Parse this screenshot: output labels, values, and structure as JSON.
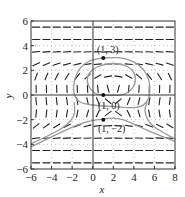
{
  "chart_data": {
    "type": "slope_field",
    "title": "",
    "xlabel": "x",
    "ylabel": "y",
    "xlim": [
      -6,
      8
    ],
    "ylim": [
      -6,
      6
    ],
    "xticks": [
      -6,
      -4,
      -2,
      0,
      2,
      4,
      6,
      8
    ],
    "yticks": [
      -6,
      -4,
      -2,
      0,
      2,
      4,
      6
    ],
    "grid": "dotted",
    "points": [
      {
        "x": 1,
        "y": 3,
        "label": "(1, 3)"
      },
      {
        "x": 1,
        "y": 0,
        "label": "(1, 0)"
      },
      {
        "x": 1,
        "y": -2,
        "label": "(1, −2)"
      }
    ],
    "solution_curves": [
      {
        "through": "(1, 3)",
        "shape": "closed loop around center near (2, 1)"
      },
      {
        "through": "(1, 0)",
        "shape": "inner closed loop around center near (2, 1)"
      },
      {
        "through": "(1, -2)",
        "shape": "open arch, peak near (2, -1.8), descending to lower left and lower right"
      }
    ]
  },
  "labels": {
    "x_axis": "x",
    "y_axis": "y",
    "x_ticks": [
      "−6",
      "−4",
      "−2",
      "0",
      "2",
      "4",
      "6",
      "8"
    ],
    "y_ticks": [
      "6",
      "4",
      "2",
      "0",
      "−2",
      "−4",
      "−6"
    ],
    "p1": "(1, 3)",
    "p2": "(1, 0)",
    "p3": "(1, −2)"
  },
  "colors": {
    "frame": "#333333",
    "segments": "#222222",
    "curves": "#9a9a9a",
    "grid": "#999999",
    "points": "#111111"
  }
}
